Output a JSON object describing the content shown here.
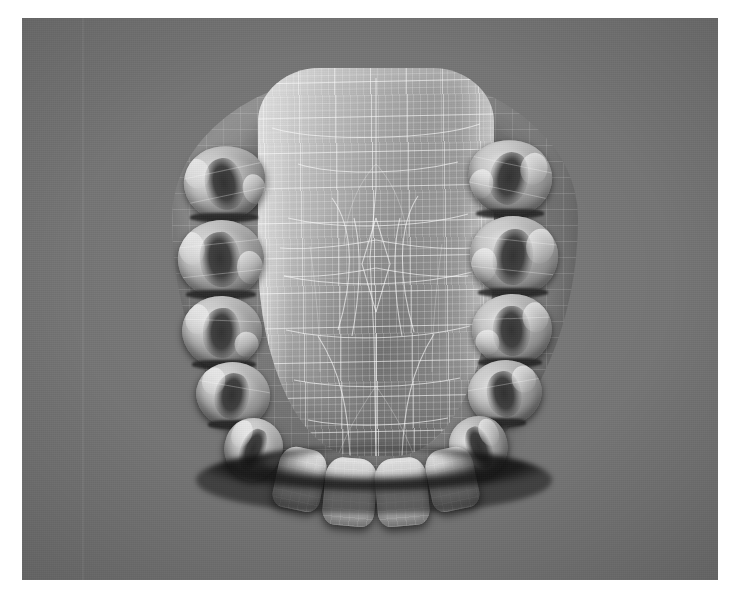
{
  "image": {
    "kind": "3d-render-screenshot",
    "subject": "Maxillary (upper) dental arch cast",
    "view": "occlusal view from below",
    "render_mode": "shaded surface with wireframe mesh overlay",
    "color_mode": "grayscale"
  },
  "canvas": {
    "page_width": 742,
    "page_height": 598,
    "viewport_left": 22,
    "viewport_top": 18,
    "viewport_width": 696,
    "viewport_height": 562,
    "background_color": "#757575",
    "page_margin_color": "#ffffff"
  },
  "palette": {
    "background_gray": "#757575",
    "gingiva_gray": "#8a8a8a",
    "palate_light": "#d4d4d4",
    "palate_mid": "#9c9c9c",
    "palate_dark": "#8f8f8f",
    "shadow_dark": "#3a3a3a",
    "occlusal_shadow": "#141414",
    "wireframe_line": "#ffffff",
    "tooth_enamel": "#d8d8d8",
    "tooth_fossa": "#2e2e2e"
  },
  "model": {
    "name": "maxillary-arch",
    "left": 128,
    "top": 32,
    "width": 450,
    "height": 470,
    "regions": [
      {
        "name": "palate",
        "label": "Hard palate (domed plate)"
      },
      {
        "name": "alveolar-ridge",
        "label": "Alveolar ridge / gingiva"
      },
      {
        "name": "vestibule-shadow-left",
        "label": "Left posterior vestibule shadow"
      },
      {
        "name": "vestibule-shadow-right",
        "label": "Right posterior vestibule shadow"
      },
      {
        "name": "incisal-shadow",
        "label": "Anterior incisal edge shadow"
      }
    ],
    "wireframe": {
      "visible": true,
      "line_color": "#ffffff",
      "fine_spacing_px": 7,
      "coarse_spacing_px": 35,
      "overlay_opacity": 0.45
    }
  },
  "teeth": {
    "left_quadrant": [
      {
        "id": "UL7",
        "label": "Second molar",
        "x": 34,
        "y": 96,
        "w": 82,
        "h": 74,
        "rot": -12
      },
      {
        "id": "UL6",
        "label": "First molar",
        "x": 28,
        "y": 170,
        "w": 86,
        "h": 78,
        "rot": -6
      },
      {
        "id": "UL5",
        "label": "Second premolar",
        "x": 32,
        "y": 246,
        "w": 80,
        "h": 72,
        "rot": 2
      },
      {
        "id": "UL4",
        "label": "First premolar",
        "x": 46,
        "y": 312,
        "w": 74,
        "h": 66,
        "rot": 10
      },
      {
        "id": "UL3",
        "label": "Canine",
        "x": 74,
        "y": 368,
        "w": 58,
        "h": 62,
        "rot": 20
      }
    ],
    "right_quadrant": [
      {
        "id": "UR7",
        "label": "Second molar",
        "x": 318,
        "y": 90,
        "w": 84,
        "h": 76,
        "rot": 12
      },
      {
        "id": "UR6",
        "label": "First molar",
        "x": 320,
        "y": 166,
        "w": 88,
        "h": 80,
        "rot": 6
      },
      {
        "id": "UR5",
        "label": "Second premolar",
        "x": 322,
        "y": 244,
        "w": 80,
        "h": 72,
        "rot": -2
      },
      {
        "id": "UR4",
        "label": "First premolar",
        "x": 318,
        "y": 310,
        "w": 74,
        "h": 66,
        "rot": -10
      },
      {
        "id": "UR3",
        "label": "Canine",
        "x": 300,
        "y": 366,
        "w": 58,
        "h": 62,
        "rot": -20
      }
    ],
    "anterior": [
      {
        "id": "UL2",
        "label": "Lateral incisor",
        "x": 126,
        "y": 398,
        "w": 48,
        "h": 62,
        "rot": 12
      },
      {
        "id": "UL1",
        "label": "Central incisor",
        "x": 174,
        "y": 410,
        "w": 52,
        "h": 66,
        "rot": 5
      },
      {
        "id": "UR1",
        "label": "Central incisor",
        "x": 226,
        "y": 410,
        "w": 52,
        "h": 66,
        "rot": -5
      },
      {
        "id": "UR2",
        "label": "Lateral incisor",
        "x": 278,
        "y": 398,
        "w": 48,
        "h": 62,
        "rot": -12
      }
    ]
  },
  "artifacts": {
    "scan_seam_x": 60,
    "grain_opacity": 0.3
  }
}
